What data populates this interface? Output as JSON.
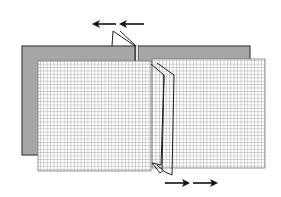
{
  "diagram": {
    "colors": {
      "background": "#ffffff",
      "back_panel_fill": "#a6a6a6",
      "back_panel_stroke": "#444444",
      "grid_fill": "#ffffff",
      "grid_line": "#9a9a9a",
      "grid_border": "#7a7a7a",
      "connector_line": "#222222",
      "arrow": "#111111"
    },
    "back_panels": [
      {
        "name": "left-back-panel",
        "x": 22,
        "y": 46,
        "w": 114,
        "h": 109
      },
      {
        "name": "right-back-panel",
        "x": 138,
        "y": 46,
        "w": 112,
        "h": 16
      }
    ],
    "grid_panels": [
      {
        "name": "left-grid-panel",
        "x": 38,
        "y": 61,
        "w": 113,
        "h": 110,
        "cell": 3.4
      },
      {
        "name": "right-grid-panel",
        "x": 152,
        "y": 59,
        "w": 113,
        "h": 109,
        "cell": 3.4
      }
    ],
    "arrows": [
      {
        "name": "top-arrow-1",
        "direction": "left",
        "x1": 116,
        "x2": 94,
        "y": 24
      },
      {
        "name": "top-arrow-2",
        "direction": "left",
        "x1": 144,
        "x2": 121,
        "y": 24
      },
      {
        "name": "bottom-arrow-1",
        "direction": "right",
        "x1": 165,
        "x2": 188,
        "y": 183
      },
      {
        "name": "bottom-arrow-2",
        "direction": "right",
        "x1": 193,
        "x2": 216,
        "y": 183
      }
    ]
  }
}
